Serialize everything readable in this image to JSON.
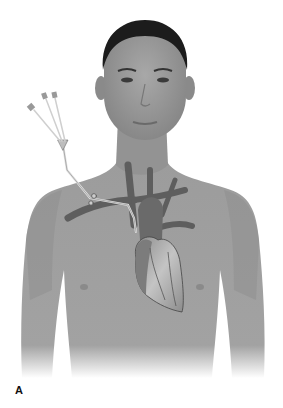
{
  "figure": {
    "panel_label": "A",
    "style": "grayscale medical illustration",
    "colors": {
      "background": "#ffffff",
      "skin": "#9a9a9a",
      "skin_shadow": "#858585",
      "hair": "#1c1c1c",
      "vessel": "#5e5e5e",
      "heart": "#7a7a7a",
      "heart_highlight": "#c8c8c8",
      "catheter": "#d8d8d8"
    },
    "catheter_lumens": 3
  }
}
